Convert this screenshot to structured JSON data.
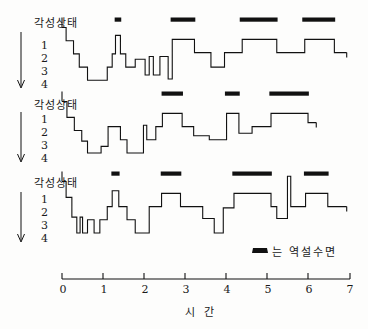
{
  "figure": {
    "x_axis_title": "시 간",
    "x_ticks": [
      "0",
      "1",
      "2",
      "3",
      "4",
      "5",
      "6",
      "7"
    ],
    "y_axis_title": "각성상태",
    "y_ticks": [
      "1",
      "2",
      "3",
      "4"
    ],
    "legend_text": "는 역설수면",
    "legend_swatch": "rem-bar-swatch",
    "arrow_icon": "down-arrow-icon"
  },
  "chart_data": {
    "type": "line",
    "title": "각성상태",
    "xlabel": "시 간",
    "ylabel": "각성상태",
    "xlim": [
      0,
      7
    ],
    "ylim": [
      0,
      4
    ],
    "grid": false,
    "legend": {
      "position": "bottom-right",
      "entries": [
        {
          "marker": "filled-black-bar",
          "label": "는 역설수면"
        }
      ]
    },
    "note": "Hypnogram: three subjects. Y = sleep stage, 0 = awake (각성상태) at top, 1-4 = sleep stages descending. Black bars mark REM / paradoxical sleep (역설수면).",
    "series": [
      {
        "name": "subject-1",
        "steps": [
          {
            "t0": 0.0,
            "t1": 0.1,
            "stage": 0.0
          },
          {
            "t0": 0.1,
            "t1": 0.28,
            "stage": 1.0
          },
          {
            "t0": 0.28,
            "t1": 0.42,
            "stage": 2.0
          },
          {
            "t0": 0.42,
            "t1": 0.62,
            "stage": 3.0
          },
          {
            "t0": 0.62,
            "t1": 1.1,
            "stage": 4.0
          },
          {
            "t0": 1.1,
            "t1": 1.22,
            "stage": 3.0
          },
          {
            "t0": 1.22,
            "t1": 1.3,
            "stage": 2.0
          },
          {
            "t0": 1.3,
            "t1": 1.42,
            "stage": 0.6
          },
          {
            "t0": 1.42,
            "t1": 1.55,
            "stage": 2.0
          },
          {
            "t0": 1.55,
            "t1": 1.78,
            "stage": 3.0
          },
          {
            "t0": 1.78,
            "t1": 2.02,
            "stage": 2.4
          },
          {
            "t0": 2.02,
            "t1": 2.12,
            "stage": 3.6
          },
          {
            "t0": 2.12,
            "t1": 2.22,
            "stage": 2.2
          },
          {
            "t0": 2.22,
            "t1": 2.38,
            "stage": 3.6
          },
          {
            "t0": 2.38,
            "t1": 2.58,
            "stage": 2.2
          },
          {
            "t0": 2.58,
            "t1": 2.68,
            "stage": 3.9
          },
          {
            "t0": 2.68,
            "t1": 3.22,
            "stage": 0.9
          },
          {
            "t0": 3.22,
            "t1": 3.62,
            "stage": 1.9
          },
          {
            "t0": 3.62,
            "t1": 3.95,
            "stage": 3.0
          },
          {
            "t0": 3.95,
            "t1": 4.38,
            "stage": 1.9
          },
          {
            "t0": 4.38,
            "t1": 5.22,
            "stage": 0.9
          },
          {
            "t0": 5.22,
            "t1": 5.9,
            "stage": 1.9
          },
          {
            "t0": 5.9,
            "t1": 6.62,
            "stage": 0.9
          },
          {
            "t0": 6.62,
            "t1": 6.92,
            "stage": 1.9
          }
        ],
        "rem_bars": [
          {
            "t0": 1.28,
            "t1": 1.44
          },
          {
            "t0": 2.64,
            "t1": 3.24
          },
          {
            "t0": 4.32,
            "t1": 5.24
          },
          {
            "t0": 5.84,
            "t1": 6.64
          }
        ]
      },
      {
        "name": "subject-2",
        "steps": [
          {
            "t0": 0.0,
            "t1": 0.12,
            "stage": 0.0
          },
          {
            "t0": 0.12,
            "t1": 0.3,
            "stage": 1.2
          },
          {
            "t0": 0.3,
            "t1": 0.48,
            "stage": 2.2
          },
          {
            "t0": 0.48,
            "t1": 0.62,
            "stage": 3.0
          },
          {
            "t0": 0.62,
            "t1": 0.95,
            "stage": 3.9
          },
          {
            "t0": 0.95,
            "t1": 1.12,
            "stage": 3.4
          },
          {
            "t0": 1.12,
            "t1": 1.42,
            "stage": 1.9
          },
          {
            "t0": 1.42,
            "t1": 1.58,
            "stage": 2.9
          },
          {
            "t0": 1.58,
            "t1": 1.98,
            "stage": 3.9
          },
          {
            "t0": 1.98,
            "t1": 2.06,
            "stage": 1.8
          },
          {
            "t0": 2.06,
            "t1": 2.28,
            "stage": 2.9
          },
          {
            "t0": 2.28,
            "t1": 2.44,
            "stage": 1.9
          },
          {
            "t0": 2.44,
            "t1": 2.92,
            "stage": 0.9
          },
          {
            "t0": 2.92,
            "t1": 3.2,
            "stage": 1.9
          },
          {
            "t0": 3.2,
            "t1": 3.58,
            "stage": 2.6
          },
          {
            "t0": 3.58,
            "t1": 4.0,
            "stage": 2.9
          },
          {
            "t0": 4.0,
            "t1": 4.3,
            "stage": 0.9
          },
          {
            "t0": 4.3,
            "t1": 4.62,
            "stage": 2.4
          },
          {
            "t0": 4.62,
            "t1": 5.08,
            "stage": 1.9
          },
          {
            "t0": 5.08,
            "t1": 5.98,
            "stage": 0.9
          },
          {
            "t0": 5.98,
            "t1": 6.18,
            "stage": 1.6
          }
        ],
        "rem_bars": [
          {
            "t0": 2.42,
            "t1": 2.94
          },
          {
            "t0": 3.96,
            "t1": 4.32
          },
          {
            "t0": 5.04,
            "t1": 6.0
          }
        ]
      },
      {
        "name": "subject-3",
        "steps": [
          {
            "t0": 0.0,
            "t1": 0.1,
            "stage": 0.0
          },
          {
            "t0": 0.1,
            "t1": 0.24,
            "stage": 1.2
          },
          {
            "t0": 0.24,
            "t1": 0.36,
            "stage": 2.7
          },
          {
            "t0": 0.36,
            "t1": 0.44,
            "stage": 3.9
          },
          {
            "t0": 0.44,
            "t1": 0.5,
            "stage": 2.7
          },
          {
            "t0": 0.5,
            "t1": 0.62,
            "stage": 3.9
          },
          {
            "t0": 0.62,
            "t1": 0.78,
            "stage": 2.9
          },
          {
            "t0": 0.78,
            "t1": 0.92,
            "stage": 3.9
          },
          {
            "t0": 0.92,
            "t1": 1.1,
            "stage": 2.9
          },
          {
            "t0": 1.1,
            "t1": 1.22,
            "stage": 1.9
          },
          {
            "t0": 1.22,
            "t1": 1.38,
            "stage": 0.7
          },
          {
            "t0": 1.38,
            "t1": 1.58,
            "stage": 1.9
          },
          {
            "t0": 1.58,
            "t1": 1.78,
            "stage": 2.9
          },
          {
            "t0": 1.78,
            "t1": 2.12,
            "stage": 3.9
          },
          {
            "t0": 2.12,
            "t1": 2.42,
            "stage": 1.9
          },
          {
            "t0": 2.42,
            "t1": 2.88,
            "stage": 0.9
          },
          {
            "t0": 2.88,
            "t1": 3.42,
            "stage": 1.9
          },
          {
            "t0": 3.42,
            "t1": 3.7,
            "stage": 2.8
          },
          {
            "t0": 3.7,
            "t1": 3.92,
            "stage": 3.9
          },
          {
            "t0": 3.92,
            "t1": 4.18,
            "stage": 2.0
          },
          {
            "t0": 4.18,
            "t1": 5.08,
            "stage": 0.9
          },
          {
            "t0": 5.08,
            "t1": 5.22,
            "stage": 1.9
          },
          {
            "t0": 5.22,
            "t1": 5.48,
            "stage": 2.8
          },
          {
            "t0": 5.48,
            "t1": 5.56,
            "stage": -0.4
          },
          {
            "t0": 5.56,
            "t1": 5.92,
            "stage": 1.9
          },
          {
            "t0": 5.92,
            "t1": 6.46,
            "stage": 0.9
          },
          {
            "t0": 6.46,
            "t1": 6.92,
            "stage": 1.9
          }
        ],
        "rem_bars": [
          {
            "t0": 1.2,
            "t1": 1.4
          },
          {
            "t0": 2.4,
            "t1": 2.9
          },
          {
            "t0": 4.14,
            "t1": 5.1
          },
          {
            "t0": 5.88,
            "t1": 6.48
          }
        ]
      }
    ]
  }
}
